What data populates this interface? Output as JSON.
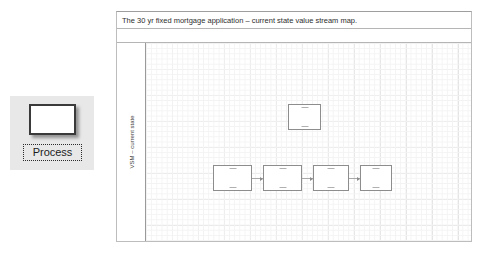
{
  "stencil": {
    "shape_name": "process-shape",
    "label": "Process"
  },
  "diagram": {
    "title": "The 30 yr fixed mortgage application – current state value stream map.",
    "lane_label": "VSM – current state",
    "nodes": [
      {
        "id": "node-top",
        "label": "",
        "x": 142,
        "y": 61,
        "w": 33,
        "h": 26
      },
      {
        "id": "node-1",
        "label": "",
        "x": 67,
        "y": 122,
        "w": 39,
        "h": 26
      },
      {
        "id": "node-2",
        "label": "",
        "x": 117,
        "y": 122,
        "w": 39,
        "h": 26
      },
      {
        "id": "node-3",
        "label": "",
        "x": 167,
        "y": 122,
        "w": 36,
        "h": 26
      },
      {
        "id": "node-4",
        "label": "",
        "x": 214,
        "y": 122,
        "w": 32,
        "h": 26
      }
    ],
    "connectors": [
      {
        "id": "connector-1-2",
        "x": 106,
        "y": 135,
        "w": 11
      },
      {
        "id": "connector-2-3",
        "x": 156,
        "y": 135,
        "w": 11
      },
      {
        "id": "connector-3-4",
        "x": 203,
        "y": 135,
        "w": 11
      }
    ],
    "colors": {
      "node_border": "#8d8d8d",
      "frame_border": "#bdbdbd",
      "grid_minor": "#f3f3f3",
      "grid_major": "#e3e3e3",
      "palette_bg": "#e8e8e8"
    }
  }
}
